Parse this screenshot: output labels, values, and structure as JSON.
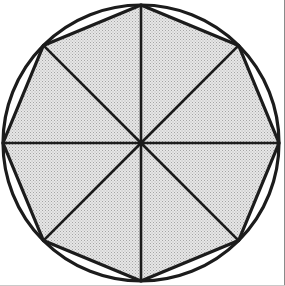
{
  "figure": {
    "canvas": {
      "width": 285,
      "height": 286,
      "background": "#ffffff"
    },
    "colors": {
      "stroke": "#1c1c1c",
      "fill_light": "#e2e2e2",
      "fill_dot": "#9d9d9d",
      "fill_average": "#d4d4d4",
      "background": "#ffffff",
      "border": "#8a8a8a"
    },
    "circle": {
      "name": "circumscribed-circle",
      "center_x": 141,
      "center_y": 143,
      "radius": 138,
      "stroke_width": 3.2,
      "fill": "none"
    },
    "polygon": {
      "name": "inscribed-regular-octagon",
      "sides": 8,
      "center_x": 141,
      "center_y": 143,
      "circumradius": 138,
      "rotation_degrees": 90,
      "stroke_width": 3.2,
      "fill": "halftone-gray-stipple",
      "vertices": [
        {
          "label": "top",
          "angle": 90,
          "x": 141,
          "y": 5
        },
        {
          "label": "top-right",
          "angle": 45,
          "x": 238.6,
          "y": 45.4
        },
        {
          "label": "right",
          "angle": 0,
          "x": 279,
          "y": 143
        },
        {
          "label": "bottom-right",
          "angle": 315,
          "x": 238.6,
          "y": 240.6
        },
        {
          "label": "bottom",
          "angle": 270,
          "x": 141,
          "y": 281
        },
        {
          "label": "bottom-left",
          "angle": 225,
          "x": 43.4,
          "y": 240.6
        },
        {
          "label": "left",
          "angle": 180,
          "x": 3,
          "y": 143
        },
        {
          "label": "top-left",
          "angle": 135,
          "x": 43.4,
          "y": 45.4
        }
      ]
    },
    "radii": {
      "name": "center-to-vertex-radii",
      "count": 8,
      "stroke_width": 2.6,
      "angles_degrees": [
        0,
        45,
        90,
        135,
        180,
        225,
        270,
        315
      ]
    },
    "regions": {
      "name": "triangular-sectors",
      "count": 8,
      "description": "eight congruent isosceles triangles"
    }
  },
  "chart_data": {
    "type": "pie",
    "categories": [
      "1",
      "2",
      "3",
      "4",
      "5",
      "6",
      "7",
      "8"
    ],
    "values": [
      45,
      45,
      45,
      45,
      45,
      45,
      45,
      45
    ],
    "xlabel": "",
    "ylabel": "",
    "legend": "none",
    "grid": false
  }
}
